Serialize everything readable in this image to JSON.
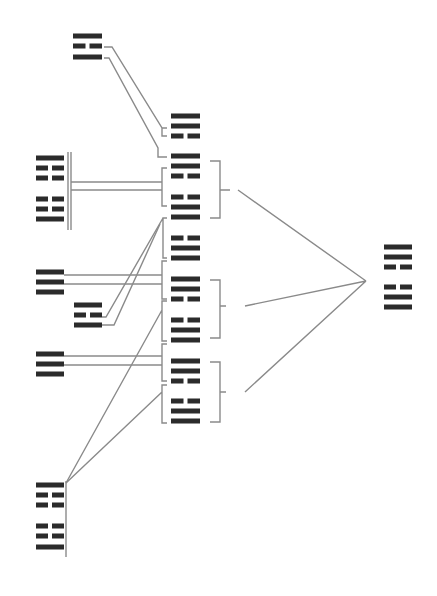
{
  "diagram": {
    "title": "",
    "colors": {
      "bar": "#2b2b2b",
      "line": "#8a8a8a",
      "background": "#ffffff"
    },
    "figures": [
      {
        "id": "top-left-trigram",
        "x": 73,
        "w": 29,
        "lines": [
          {
            "y": 36,
            "type": "solid"
          },
          {
            "y": 46,
            "type": "broken"
          },
          {
            "y": 57,
            "type": "solid"
          }
        ]
      },
      {
        "id": "mid-trigram-a",
        "x": 171,
        "w": 29,
        "lines": [
          {
            "y": 116,
            "type": "solid"
          },
          {
            "y": 126,
            "type": "solid"
          },
          {
            "y": 136,
            "type": "broken"
          }
        ]
      },
      {
        "id": "mid-group1-top-line",
        "x": 171,
        "w": 29,
        "lines": [
          {
            "y": 156,
            "type": "solid"
          }
        ]
      },
      {
        "id": "mid-group1-upper",
        "x": 171,
        "w": 29,
        "lines": [
          {
            "y": 166,
            "type": "solid"
          },
          {
            "y": 176,
            "type": "broken"
          }
        ]
      },
      {
        "id": "mid-group1-lower",
        "x": 171,
        "w": 29,
        "lines": [
          {
            "y": 197,
            "type": "broken"
          },
          {
            "y": 207,
            "type": "solid"
          },
          {
            "y": 217,
            "type": "solid"
          }
        ]
      },
      {
        "id": "left-hexagram-1",
        "x": 36,
        "w": 28,
        "lines": [
          {
            "y": 158,
            "type": "solid"
          },
          {
            "y": 168,
            "type": "broken"
          },
          {
            "y": 178,
            "type": "broken"
          },
          {
            "y": 199,
            "type": "broken"
          },
          {
            "y": 209,
            "type": "broken"
          },
          {
            "y": 219,
            "type": "solid"
          }
        ]
      },
      {
        "id": "mid-trigram-b",
        "x": 171,
        "w": 29,
        "lines": [
          {
            "y": 238,
            "type": "broken"
          },
          {
            "y": 248,
            "type": "solid"
          },
          {
            "y": 258,
            "type": "solid"
          }
        ]
      },
      {
        "id": "mid-group2-upper",
        "x": 171,
        "w": 29,
        "lines": [
          {
            "y": 279,
            "type": "solid"
          },
          {
            "y": 289,
            "type": "solid"
          },
          {
            "y": 299,
            "type": "broken"
          }
        ]
      },
      {
        "id": "mid-group2-lower",
        "x": 171,
        "w": 29,
        "lines": [
          {
            "y": 320,
            "type": "broken"
          },
          {
            "y": 330,
            "type": "solid"
          }
        ]
      },
      {
        "id": "mid-group3-top-line",
        "x": 171,
        "w": 29,
        "lines": [
          {
            "y": 340,
            "type": "solid"
          }
        ]
      },
      {
        "id": "left-trigram-qian-1",
        "x": 36,
        "w": 28,
        "lines": [
          {
            "y": 272,
            "type": "solid"
          },
          {
            "y": 282,
            "type": "solid"
          },
          {
            "y": 292,
            "type": "solid"
          }
        ]
      },
      {
        "id": "small-trigram",
        "x": 74,
        "w": 28,
        "lines": [
          {
            "y": 305,
            "type": "solid"
          },
          {
            "y": 315,
            "type": "broken"
          },
          {
            "y": 325,
            "type": "solid"
          }
        ]
      },
      {
        "id": "left-trigram-qian-2",
        "x": 36,
        "w": 28,
        "lines": [
          {
            "y": 354,
            "type": "solid"
          },
          {
            "y": 364,
            "type": "solid"
          },
          {
            "y": 374,
            "type": "solid"
          }
        ]
      },
      {
        "id": "mid-group3-upper",
        "x": 171,
        "w": 29,
        "lines": [
          {
            "y": 361,
            "type": "solid"
          },
          {
            "y": 371,
            "type": "solid"
          },
          {
            "y": 381,
            "type": "broken"
          }
        ]
      },
      {
        "id": "mid-group3-lower",
        "x": 171,
        "w": 29,
        "lines": [
          {
            "y": 401,
            "type": "broken"
          },
          {
            "y": 411,
            "type": "solid"
          },
          {
            "y": 421,
            "type": "solid"
          }
        ]
      },
      {
        "id": "right-hexagram",
        "x": 384,
        "w": 28,
        "lines": [
          {
            "y": 247,
            "type": "solid"
          },
          {
            "y": 257,
            "type": "solid"
          },
          {
            "y": 267,
            "type": "broken"
          },
          {
            "y": 287,
            "type": "broken"
          },
          {
            "y": 297,
            "type": "solid"
          },
          {
            "y": 307,
            "type": "solid"
          }
        ]
      },
      {
        "id": "bottom-left-hexagram",
        "x": 36,
        "w": 28,
        "lines": [
          {
            "y": 485,
            "type": "solid"
          },
          {
            "y": 495,
            "type": "broken"
          },
          {
            "y": 505,
            "type": "broken"
          },
          {
            "y": 526,
            "type": "broken"
          },
          {
            "y": 536,
            "type": "broken"
          },
          {
            "y": 547,
            "type": "solid"
          }
        ]
      }
    ],
    "connectors": [
      "M104 47 H112 L162 128 V136 L167 136 M162 128 L167 128",
      "M104 58 H109 L158 148 V157 H167",
      "M68 152 V230 M71 152 V230",
      "M71 182 H162 M71 190 H162",
      "M167 168 H162 V206 H167",
      "M167 218 H163 V258 H167 M163 218 L106 317 H102 M163 218",
      "M160 224 L114 325 H102",
      "M64 275 H162 M64 284 H162",
      "M167 261 H162 V299 H167",
      "M167 301 H162 V341 H167 M162 310 L66 483",
      "M64 356 H162 M64 365 H162",
      "M167 344 H162 V381 H167",
      "M167 385 H162 V423 H167 M162 392 L66 483",
      "M66 481 V557",
      "M210 161 H220 V218 H210 M220 190 H230",
      "M210 280 H220 V338 H210 M220 306 H226",
      "M210 362 H220 V422 H210 M220 392 H226",
      "M238 190 L366 281 M245 306 L366 281 M245 392 L366 281"
    ]
  }
}
